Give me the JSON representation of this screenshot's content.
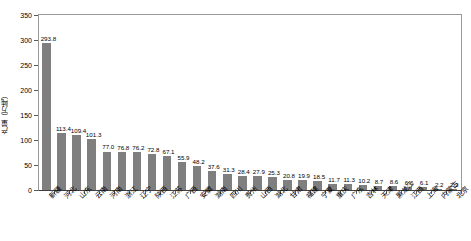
{
  "chart_data": {
    "type": "bar",
    "title": "",
    "xlabel": "",
    "ylabel": "产量（万吨）",
    "ylim": [
      0,
      350
    ],
    "yticks": [
      0,
      50,
      100,
      150,
      200,
      250,
      300,
      350
    ],
    "grid": false,
    "legend": "none",
    "bar_color": "#7f7f7f",
    "categories": [
      "新疆",
      "河北",
      "山东",
      "云南",
      "河南",
      "浙江",
      "辽宁",
      "陕西",
      "江苏",
      "广西",
      "安徽",
      "湖南",
      "四川",
      "贵州",
      "山西",
      "湖北",
      "甘肃",
      "福建",
      "宁夏",
      "重庆",
      "广东",
      "吉林",
      "天津",
      "黑龙江",
      "江西",
      "上海",
      "内蒙古",
      "北京"
    ],
    "values": [
      293.8,
      113.4,
      109.4,
      101.3,
      77.0,
      76.8,
      76.2,
      72.8,
      67.1,
      55.9,
      48.2,
      37.6,
      31.3,
      28.4,
      27.9,
      25.3,
      20.8,
      19.9,
      18.5,
      11.7,
      11.3,
      10.2,
      8.7,
      8.6,
      6.6,
      6.1,
      2.2,
      2.2
    ],
    "value_labels": [
      "293.8",
      "113.4",
      "109.4",
      "101.3",
      "77.0",
      "76.8",
      "76.2",
      "72.8",
      "67.1",
      "55.9",
      "48.2",
      "37.6",
      "31.3",
      "28.4",
      "27.9",
      "25.3",
      "20.8",
      "19.9",
      "18.5",
      "11.7",
      "11.3",
      "10.2",
      "8.7",
      "8.6",
      "6.6",
      "6.1",
      "2.2",
      "2.2"
    ]
  }
}
